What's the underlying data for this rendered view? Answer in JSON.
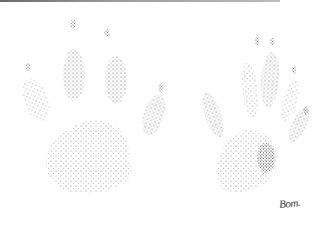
{
  "illustration": {
    "subject": "stippled animal paw prints",
    "prints": [
      {
        "name": "left-print",
        "type": "front-paw",
        "toes": 5
      },
      {
        "name": "right-print",
        "type": "hind-paw",
        "toes": 5
      }
    ],
    "signature": "Bom.",
    "colors": {
      "background": "#ffffff",
      "ink": "#2a2a2a",
      "top_rule": "#6a6a6a"
    }
  }
}
